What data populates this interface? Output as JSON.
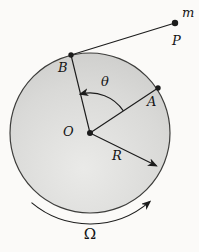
{
  "figure": {
    "labels": {
      "mass": "m",
      "external_point": "P",
      "point_b": "B",
      "angle_theta": "θ",
      "point_a": "A",
      "center": "O",
      "radius": "R",
      "angular_velocity": "Ω"
    },
    "colors": {
      "background": "#fbfaf8",
      "disk_light": "#eaeae8",
      "disk_mid": "#d9d9d7",
      "disk_dark": "#c5c5c3",
      "outline": "#3d3d3b",
      "line": "#1c1c1c"
    }
  }
}
